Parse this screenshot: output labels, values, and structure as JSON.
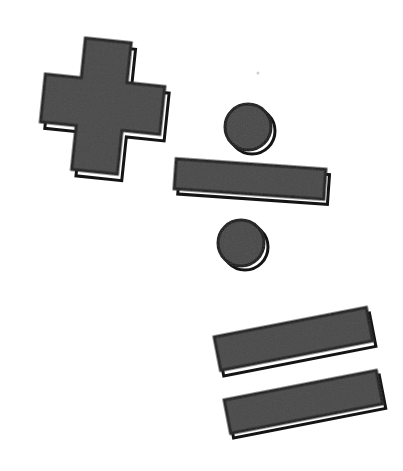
{
  "image": {
    "title": "Mathematical operator symbols",
    "description": "Three hand-cut paper style math operator symbols on a plain white background: a plus sign, a division sign, and an equals sign.",
    "background_color": "#ffffff",
    "width": 403,
    "height": 471
  },
  "style": {
    "fill_color": "#474747",
    "outline_color": "#141414",
    "highlight_color": "#ffffff",
    "outline_width": 3,
    "highlight_offset": 4,
    "texture": "flat matte dark gray with faint grain"
  },
  "symbols": [
    {
      "id": "plus",
      "name": "plus-sign",
      "glyph": "+",
      "label": "Plus",
      "meaning": "addition",
      "rotation_deg": 6,
      "center": {
        "x": 100,
        "y": 110
      },
      "bounds": {
        "x": 27,
        "y": 30,
        "width": 146,
        "height": 158
      },
      "arm_length": 146,
      "arm_thickness": 56
    },
    {
      "id": "divide",
      "name": "division-sign",
      "glyph": "÷",
      "label": "Divide",
      "meaning": "division",
      "rotation_deg": 4,
      "bounds": {
        "x": 176,
        "y": 104,
        "width": 150,
        "height": 160
      },
      "parts": [
        {
          "id": "divide-dot-top",
          "name": "division-dot-upper",
          "shape": "circle",
          "center": {
            "x": 248,
            "y": 127
          },
          "radius": 23
        },
        {
          "id": "divide-bar",
          "name": "division-bar",
          "shape": "bar",
          "center": {
            "x": 250,
            "y": 179
          },
          "length": 150,
          "thickness": 30,
          "rotation_deg": 4
        },
        {
          "id": "divide-dot-bottom",
          "name": "division-dot-lower",
          "shape": "circle",
          "center": {
            "x": 241,
            "y": 243
          },
          "radius": 23
        }
      ]
    },
    {
      "id": "equals",
      "name": "equals-sign",
      "glyph": "=",
      "label": "Equals",
      "meaning": "equality",
      "rotation_deg": -11,
      "bounds": {
        "x": 218,
        "y": 301,
        "width": 162,
        "height": 140
      },
      "parts": [
        {
          "id": "equals-bar-top",
          "name": "equals-bar-upper",
          "shape": "bar",
          "center": {
            "x": 293,
            "y": 339
          },
          "length": 155,
          "thickness": 34,
          "rotation_deg": -11
        },
        {
          "id": "equals-bar-bottom",
          "name": "equals-bar-lower",
          "shape": "bar",
          "center": {
            "x": 303,
            "y": 402
          },
          "length": 155,
          "thickness": 34,
          "rotation_deg": -11
        }
      ]
    }
  ],
  "artifacts": [
    {
      "id": "speck",
      "name": "dust-speck",
      "center": {
        "x": 258,
        "y": 73
      },
      "size": 3,
      "color": "#cfcfcf"
    }
  ]
}
